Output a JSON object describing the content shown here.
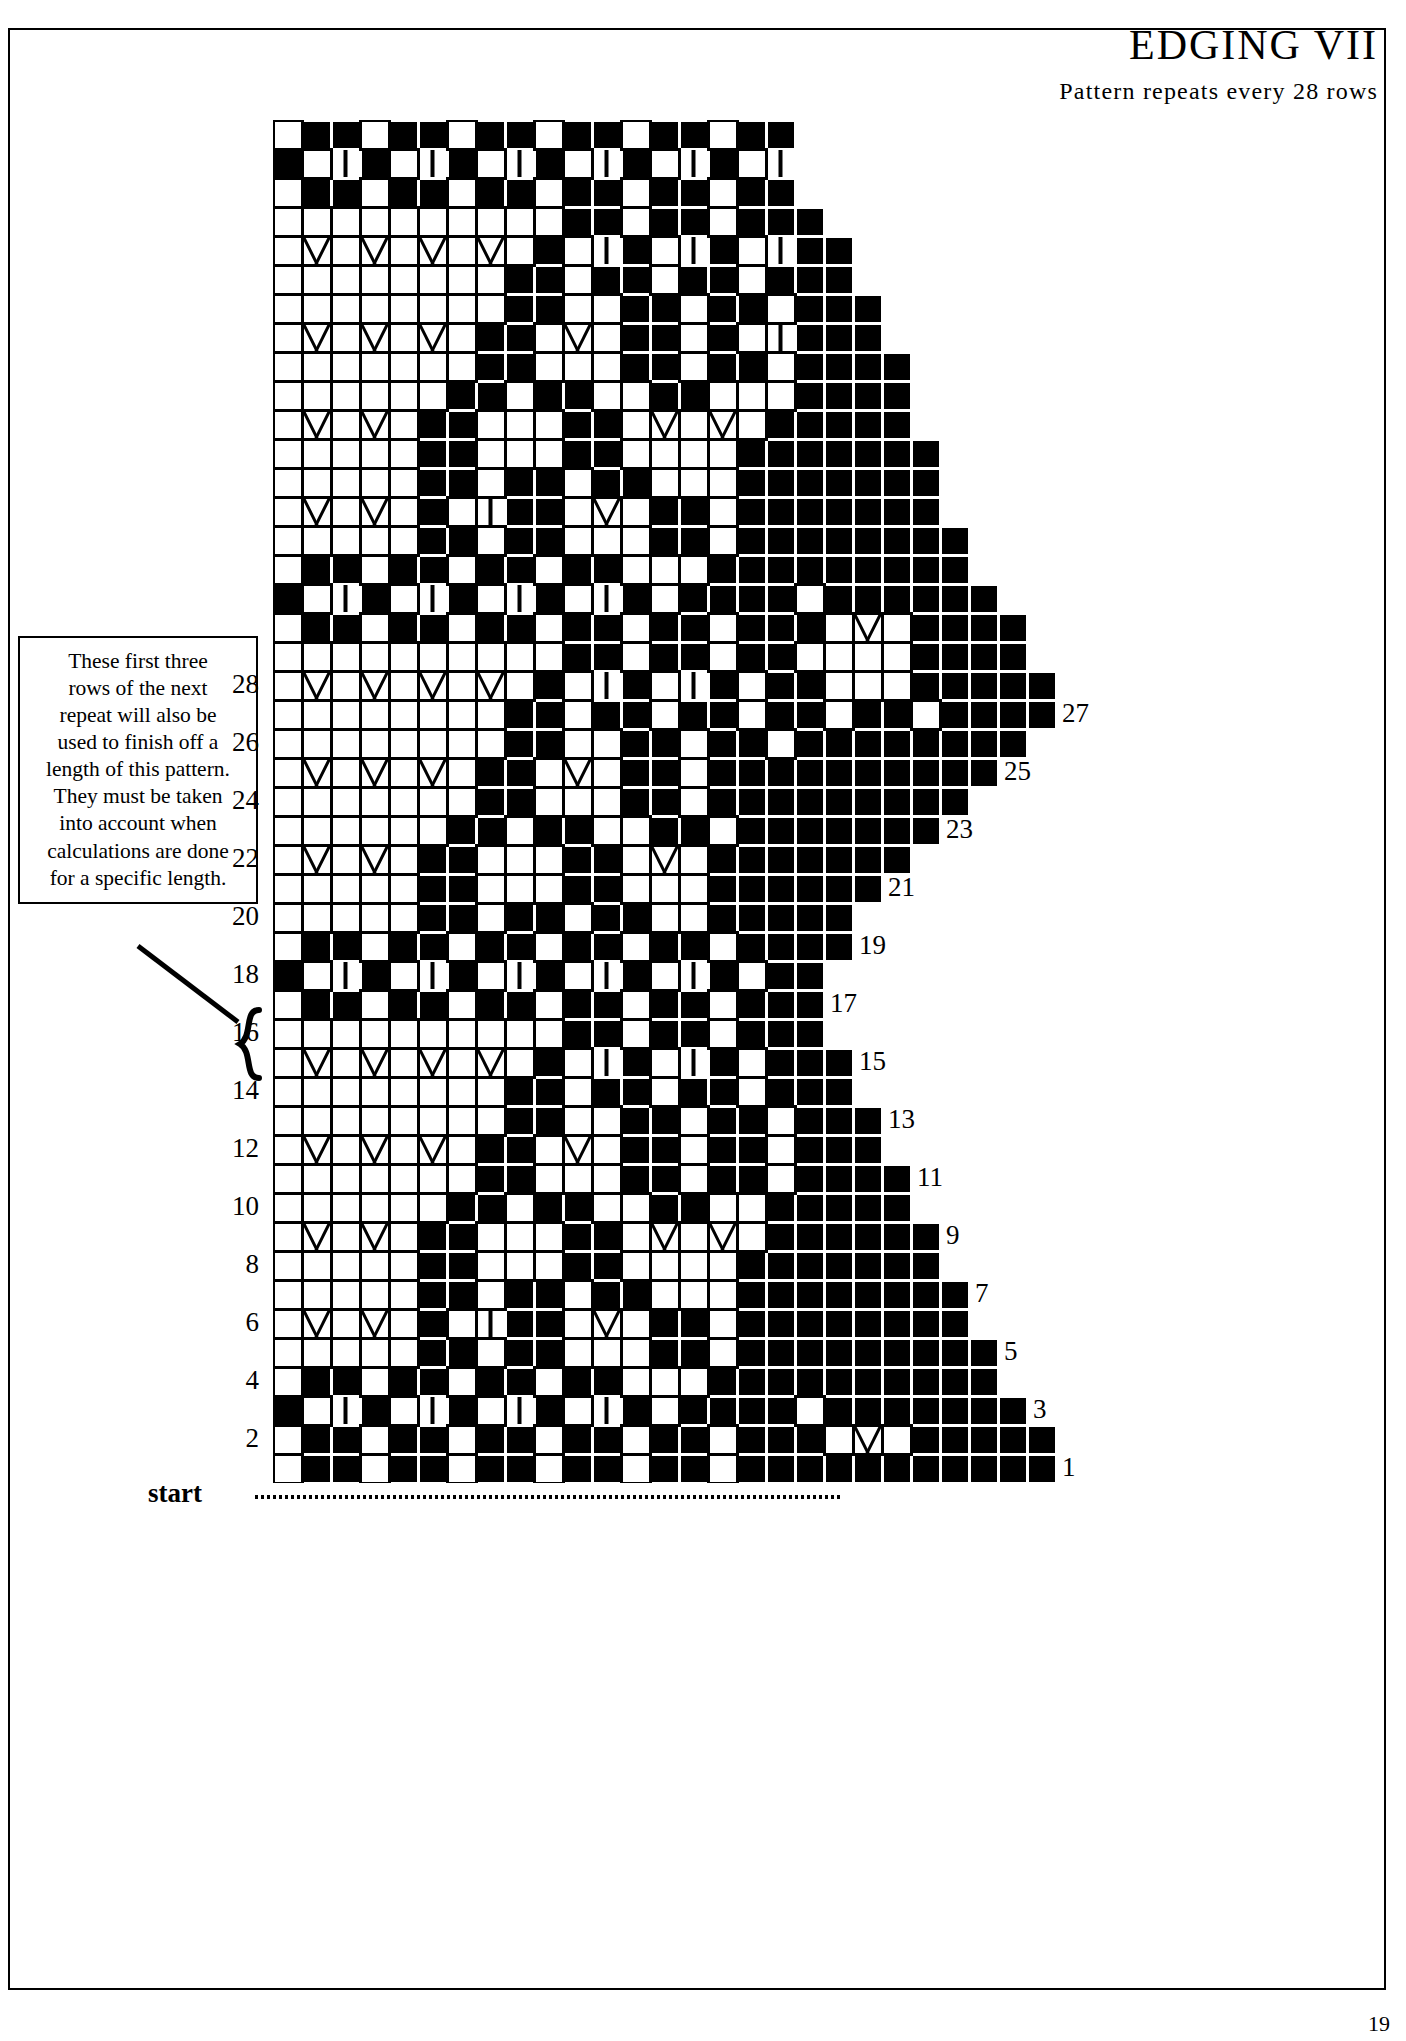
{
  "header": {
    "title": "EDGING VII",
    "subtitle": "Pattern repeats every 28 rows"
  },
  "note": {
    "lines": [
      "These first three",
      "rows of the next",
      "repeat will also be",
      "used to finish off a",
      "length of this pattern.",
      "They must be taken",
      "into account when",
      "calculations are done",
      "for a specific length."
    ]
  },
  "chart": {
    "start_label": "start",
    "left_row_numbers": [
      "28",
      "26",
      "24",
      "22",
      "20",
      "18",
      "16",
      "14",
      "12",
      "10",
      "8",
      "6",
      "4",
      "2"
    ],
    "right_row_numbers": [
      "27",
      "25",
      "23",
      "21",
      "19",
      "17",
      "15",
      "13",
      "11",
      "9",
      "7",
      "5",
      "3",
      "1"
    ],
    "cell_size": 29,
    "columns": 27,
    "rows": 47,
    "colors": {
      "filled": "#000000",
      "empty": "#ffffff",
      "grid": "#000000"
    },
    "symbols": {
      "filled": "knit-dark-square",
      "empty": "plain-open-square",
      "chevron": "decrease-chevron",
      "narrow": "narrow-bar-column"
    }
  },
  "chart_data": {
    "type": "heatmap",
    "title": "EDGING VII",
    "xlabel": "",
    "ylabel": "row",
    "note": "Knitting edging chart. Each symbol code: 1 = solid filled square, 0 = open square, 2 = open square with chevron/decrease mark, 3 = narrow open column with vertical bar, 4 = blank (outside chart).",
    "row_labels_left": [
      "28",
      "26",
      "24",
      "22",
      "20",
      "18",
      "16",
      "14",
      "12",
      "10",
      "8",
      "6",
      "4",
      "2"
    ],
    "row_labels_right": [
      "27",
      "25",
      "23",
      "21",
      "19",
      "17",
      "15",
      "13",
      "11",
      "9",
      "7",
      "5",
      "3",
      "1"
    ],
    "repeat_rows": 28,
    "legend": [
      {
        "code": 1,
        "name": "filled square"
      },
      {
        "code": 0,
        "name": "open square"
      },
      {
        "code": 2,
        "name": "chevron / decrease"
      },
      {
        "code": 3,
        "name": "narrow bar"
      },
      {
        "code": 4,
        "name": "blank"
      }
    ],
    "grid": [
      [
        0,
        1,
        1,
        0,
        1,
        1,
        0,
        1,
        1,
        0,
        1,
        1,
        0,
        1,
        1,
        0,
        1,
        1,
        4,
        4,
        4,
        4,
        4,
        4,
        4,
        4,
        4
      ],
      [
        1,
        0,
        3,
        1,
        0,
        3,
        1,
        0,
        3,
        1,
        0,
        3,
        1,
        0,
        3,
        1,
        0,
        3,
        4,
        4,
        4,
        4,
        4,
        4,
        4,
        4,
        4
      ],
      [
        0,
        1,
        1,
        0,
        1,
        1,
        0,
        1,
        1,
        0,
        1,
        1,
        0,
        1,
        1,
        0,
        1,
        1,
        4,
        4,
        4,
        4,
        4,
        4,
        4,
        4,
        4
      ],
      [
        0,
        0,
        0,
        0,
        0,
        0,
        0,
        0,
        0,
        0,
        1,
        1,
        0,
        1,
        1,
        0,
        1,
        1,
        1,
        4,
        4,
        4,
        4,
        4,
        4,
        4,
        4
      ],
      [
        0,
        2,
        0,
        2,
        0,
        2,
        0,
        2,
        0,
        1,
        0,
        3,
        1,
        0,
        3,
        1,
        0,
        3,
        1,
        1,
        4,
        4,
        4,
        4,
        4,
        4,
        4
      ],
      [
        0,
        0,
        0,
        0,
        0,
        0,
        0,
        0,
        1,
        1,
        0,
        1,
        1,
        0,
        1,
        1,
        0,
        1,
        1,
        1,
        4,
        4,
        4,
        4,
        4,
        4,
        4
      ],
      [
        0,
        0,
        0,
        0,
        0,
        0,
        0,
        0,
        1,
        1,
        0,
        0,
        1,
        1,
        0,
        1,
        1,
        0,
        1,
        1,
        1,
        4,
        4,
        4,
        4,
        4,
        4
      ],
      [
        0,
        2,
        0,
        2,
        0,
        2,
        0,
        1,
        1,
        0,
        2,
        0,
        1,
        1,
        0,
        1,
        0,
        3,
        1,
        1,
        1,
        4,
        4,
        4,
        4,
        4,
        4
      ],
      [
        0,
        0,
        0,
        0,
        0,
        0,
        0,
        1,
        1,
        0,
        0,
        0,
        1,
        1,
        0,
        1,
        1,
        0,
        1,
        1,
        1,
        1,
        4,
        4,
        4,
        4,
        4
      ],
      [
        0,
        0,
        0,
        0,
        0,
        0,
        1,
        1,
        0,
        1,
        1,
        0,
        0,
        1,
        1,
        0,
        0,
        0,
        1,
        1,
        1,
        1,
        4,
        4,
        4,
        4,
        4
      ],
      [
        0,
        2,
        0,
        2,
        0,
        1,
        1,
        0,
        0,
        0,
        1,
        1,
        0,
        2,
        0,
        2,
        0,
        1,
        1,
        1,
        1,
        1,
        4,
        4,
        4,
        4,
        4
      ],
      [
        0,
        0,
        0,
        0,
        0,
        1,
        1,
        0,
        0,
        0,
        1,
        1,
        0,
        0,
        0,
        0,
        1,
        1,
        1,
        1,
        1,
        1,
        1,
        4,
        4,
        4,
        4
      ],
      [
        0,
        0,
        0,
        0,
        0,
        1,
        1,
        0,
        1,
        1,
        0,
        1,
        1,
        0,
        0,
        0,
        1,
        1,
        1,
        1,
        1,
        1,
        1,
        4,
        4,
        4,
        4
      ],
      [
        0,
        2,
        0,
        2,
        0,
        1,
        0,
        3,
        1,
        1,
        0,
        2,
        0,
        1,
        1,
        0,
        1,
        1,
        1,
        1,
        1,
        1,
        1,
        4,
        4,
        4,
        4
      ],
      [
        0,
        0,
        0,
        0,
        0,
        1,
        1,
        0,
        1,
        1,
        0,
        0,
        0,
        1,
        1,
        0,
        1,
        1,
        1,
        1,
        1,
        1,
        1,
        1,
        4,
        4,
        4
      ],
      [
        0,
        1,
        1,
        0,
        1,
        1,
        0,
        1,
        1,
        0,
        1,
        1,
        0,
        0,
        0,
        1,
        1,
        1,
        1,
        1,
        1,
        1,
        1,
        1,
        4,
        4,
        4
      ],
      [
        1,
        0,
        3,
        1,
        0,
        3,
        1,
        0,
        3,
        1,
        0,
        3,
        1,
        0,
        1,
        1,
        1,
        1,
        0,
        1,
        1,
        1,
        1,
        1,
        1,
        4,
        4
      ],
      [
        0,
        1,
        1,
        0,
        1,
        1,
        0,
        1,
        1,
        0,
        1,
        1,
        0,
        1,
        1,
        0,
        1,
        1,
        1,
        0,
        2,
        0,
        1,
        1,
        1,
        1,
        4
      ],
      [
        0,
        0,
        0,
        0,
        0,
        0,
        0,
        0,
        0,
        0,
        1,
        1,
        0,
        1,
        1,
        0,
        1,
        1,
        0,
        0,
        0,
        0,
        1,
        1,
        1,
        1,
        4
      ],
      [
        0,
        2,
        0,
        2,
        0,
        2,
        0,
        2,
        0,
        1,
        0,
        3,
        1,
        0,
        3,
        1,
        0,
        1,
        1,
        0,
        0,
        0,
        1,
        1,
        1,
        1,
        1
      ],
      [
        0,
        0,
        0,
        0,
        0,
        0,
        0,
        0,
        1,
        1,
        0,
        1,
        1,
        0,
        1,
        1,
        0,
        1,
        1,
        0,
        1,
        1,
        0,
        1,
        1,
        1,
        1
      ],
      [
        0,
        0,
        0,
        0,
        0,
        0,
        0,
        0,
        1,
        1,
        0,
        0,
        1,
        1,
        0,
        1,
        1,
        0,
        1,
        1,
        1,
        1,
        1,
        1,
        1,
        1,
        4
      ],
      [
        0,
        2,
        0,
        2,
        0,
        2,
        0,
        1,
        1,
        0,
        2,
        0,
        1,
        1,
        0,
        1,
        1,
        1,
        1,
        1,
        1,
        1,
        1,
        1,
        1,
        4,
        4
      ],
      [
        0,
        0,
        0,
        0,
        0,
        0,
        0,
        1,
        1,
        0,
        0,
        0,
        1,
        1,
        0,
        1,
        1,
        1,
        1,
        1,
        1,
        1,
        1,
        1,
        4,
        4,
        4
      ],
      [
        0,
        0,
        0,
        0,
        0,
        0,
        1,
        1,
        0,
        1,
        1,
        0,
        0,
        1,
        1,
        0,
        1,
        1,
        1,
        1,
        1,
        1,
        1,
        4,
        4,
        4,
        4
      ],
      [
        0,
        2,
        0,
        2,
        0,
        1,
        1,
        0,
        0,
        0,
        1,
        1,
        0,
        2,
        0,
        1,
        1,
        1,
        1,
        1,
        1,
        1,
        4,
        4,
        4,
        4,
        4
      ],
      [
        0,
        0,
        0,
        0,
        0,
        1,
        1,
        0,
        0,
        0,
        1,
        1,
        0,
        0,
        0,
        1,
        1,
        1,
        1,
        1,
        1,
        4,
        4,
        4,
        4,
        4,
        4
      ],
      [
        0,
        0,
        0,
        0,
        0,
        1,
        1,
        0,
        1,
        1,
        0,
        1,
        1,
        0,
        0,
        1,
        1,
        1,
        1,
        1,
        4,
        4,
        4,
        4,
        4,
        4,
        4
      ],
      [
        0,
        1,
        1,
        0,
        1,
        1,
        0,
        1,
        1,
        0,
        1,
        1,
        0,
        1,
        1,
        0,
        1,
        1,
        1,
        1,
        4,
        4,
        4,
        4,
        4,
        4,
        4
      ],
      [
        1,
        0,
        3,
        1,
        0,
        3,
        1,
        0,
        3,
        1,
        0,
        3,
        1,
        0,
        3,
        1,
        0,
        1,
        1,
        4,
        4,
        4,
        4,
        4,
        4,
        4,
        4
      ],
      [
        0,
        1,
        1,
        0,
        1,
        1,
        0,
        1,
        1,
        0,
        1,
        1,
        0,
        1,
        1,
        0,
        1,
        1,
        1,
        4,
        4,
        4,
        4,
        4,
        4,
        4,
        4
      ],
      [
        0,
        0,
        0,
        0,
        0,
        0,
        0,
        0,
        0,
        0,
        1,
        1,
        0,
        1,
        1,
        0,
        1,
        1,
        1,
        4,
        4,
        4,
        4,
        4,
        4,
        4,
        4
      ],
      [
        0,
        2,
        0,
        2,
        0,
        2,
        0,
        2,
        0,
        1,
        0,
        3,
        1,
        0,
        3,
        1,
        0,
        1,
        1,
        1,
        4,
        4,
        4,
        4,
        4,
        4,
        4
      ],
      [
        0,
        0,
        0,
        0,
        0,
        0,
        0,
        0,
        1,
        1,
        0,
        1,
        1,
        0,
        1,
        1,
        0,
        1,
        1,
        1,
        4,
        4,
        4,
        4,
        4,
        4,
        4
      ],
      [
        0,
        0,
        0,
        0,
        0,
        0,
        0,
        0,
        1,
        1,
        0,
        0,
        1,
        1,
        0,
        1,
        1,
        0,
        1,
        1,
        1,
        4,
        4,
        4,
        4,
        4,
        4
      ],
      [
        0,
        2,
        0,
        2,
        0,
        2,
        0,
        1,
        1,
        0,
        2,
        0,
        1,
        1,
        0,
        1,
        1,
        0,
        1,
        1,
        1,
        4,
        4,
        4,
        4,
        4,
        4
      ],
      [
        0,
        0,
        0,
        0,
        0,
        0,
        0,
        1,
        1,
        0,
        0,
        0,
        1,
        1,
        0,
        1,
        1,
        0,
        1,
        1,
        1,
        1,
        4,
        4,
        4,
        4,
        4
      ],
      [
        0,
        0,
        0,
        0,
        0,
        0,
        1,
        1,
        0,
        1,
        1,
        0,
        0,
        1,
        1,
        0,
        0,
        1,
        1,
        1,
        1,
        1,
        4,
        4,
        4,
        4,
        4
      ],
      [
        0,
        2,
        0,
        2,
        0,
        1,
        1,
        0,
        0,
        0,
        1,
        1,
        0,
        2,
        0,
        2,
        0,
        1,
        1,
        1,
        1,
        1,
        1,
        4,
        4,
        4,
        4
      ],
      [
        0,
        0,
        0,
        0,
        0,
        1,
        1,
        0,
        0,
        0,
        1,
        1,
        0,
        0,
        0,
        0,
        1,
        1,
        1,
        1,
        1,
        1,
        1,
        4,
        4,
        4,
        4
      ],
      [
        0,
        0,
        0,
        0,
        0,
        1,
        1,
        0,
        1,
        1,
        0,
        1,
        1,
        0,
        0,
        0,
        1,
        1,
        1,
        1,
        1,
        1,
        1,
        1,
        4,
        4,
        4
      ],
      [
        0,
        2,
        0,
        2,
        0,
        1,
        0,
        3,
        1,
        1,
        0,
        2,
        0,
        1,
        1,
        0,
        1,
        1,
        1,
        1,
        1,
        1,
        1,
        1,
        4,
        4,
        4
      ],
      [
        0,
        0,
        0,
        0,
        0,
        1,
        1,
        0,
        1,
        1,
        0,
        0,
        0,
        1,
        1,
        0,
        1,
        1,
        1,
        1,
        1,
        1,
        1,
        1,
        1,
        4,
        4
      ],
      [
        0,
        1,
        1,
        0,
        1,
        1,
        0,
        1,
        1,
        0,
        1,
        1,
        0,
        0,
        0,
        1,
        1,
        1,
        1,
        1,
        1,
        1,
        1,
        1,
        1,
        4,
        4
      ],
      [
        1,
        0,
        3,
        1,
        0,
        3,
        1,
        0,
        3,
        1,
        0,
        3,
        1,
        0,
        1,
        1,
        1,
        1,
        0,
        1,
        1,
        1,
        1,
        1,
        1,
        1,
        4
      ],
      [
        0,
        1,
        1,
        0,
        1,
        1,
        0,
        1,
        1,
        0,
        1,
        1,
        0,
        1,
        1,
        0,
        1,
        1,
        1,
        0,
        2,
        0,
        1,
        1,
        1,
        1,
        1
      ],
      [
        0,
        1,
        1,
        0,
        1,
        1,
        0,
        1,
        1,
        0,
        1,
        1,
        0,
        1,
        1,
        0,
        1,
        1,
        1,
        1,
        1,
        1,
        1,
        1,
        1,
        1,
        1
      ]
    ]
  },
  "page": {
    "number": "19"
  }
}
